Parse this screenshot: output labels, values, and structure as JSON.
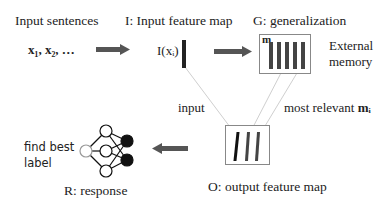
{
  "diagram": {
    "labels": {
      "input_sentences": "Input sentences",
      "input_sequence": "x₁, x₂, …",
      "input_feature_map_title": "I: Input feature map",
      "input_feature": "I(xᵢ)",
      "generalization_title": "G: generalization",
      "memory_label": "m",
      "external_memory_line1": "External",
      "external_memory_line2": "memory",
      "input_edge": "input",
      "most_relevant_edge": "most relevant ",
      "most_relevant_symbol": "mᵢ",
      "output_feature_map_title": "O: output feature map",
      "find_best_line1": "find best",
      "find_best_line2": "label",
      "response_title": "R: response"
    },
    "components": [
      {
        "id": "I",
        "name": "Input feature map"
      },
      {
        "id": "G",
        "name": "generalization"
      },
      {
        "id": "O",
        "name": "output feature map"
      },
      {
        "id": "R",
        "name": "response"
      }
    ],
    "colors": {
      "arrow": "#555555",
      "bar": "#444444",
      "box_border": "#888888",
      "connector": "#cccccc"
    }
  }
}
